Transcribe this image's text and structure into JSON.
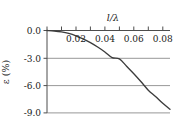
{
  "chart_data": {
    "type": "line",
    "title": "",
    "xlabel": "l/λ",
    "ylabel": "ε (%)",
    "xlim": [
      0.0,
      0.085
    ],
    "ylim": [
      -9.6,
      0.6
    ],
    "grid": true,
    "legend": null,
    "xticks": [
      0.02,
      0.04,
      0.06,
      0.08
    ],
    "xtick_labels": [
      "0.02",
      "0.04",
      "0.06",
      "0.08"
    ],
    "xminor_ticks": [
      0.0,
      0.01,
      0.02,
      0.03,
      0.04,
      0.05,
      0.06,
      0.07,
      0.08
    ],
    "yticks": [
      0.0,
      -3.0,
      -6.0,
      -9.0
    ],
    "ytick_labels": [
      "0.0",
      "-3.0",
      "-6.0",
      "-9.0"
    ],
    "gridlines_y": [
      -3.0,
      -6.0,
      -9.0
    ],
    "series": [
      {
        "name": "epsilon",
        "color": "#3c3c3c",
        "x": [
          0.0,
          0.005,
          0.01,
          0.015,
          0.02,
          0.025,
          0.03,
          0.035,
          0.04,
          0.045,
          0.05,
          0.055,
          0.06,
          0.065,
          0.07,
          0.075,
          0.08,
          0.085
        ],
        "y": [
          0.0,
          -0.05,
          -0.15,
          -0.32,
          -0.58,
          -0.92,
          -1.32,
          -1.8,
          -2.34,
          -2.96,
          -3.1,
          -3.9,
          -4.72,
          -5.6,
          -6.52,
          -7.2,
          -7.95,
          -8.6
        ]
      }
    ]
  },
  "axis_colors": {
    "frame": "#4d4d4d",
    "grid": "#8c8c8c",
    "curve": "#3c3c3c",
    "text": "#1a1a1a"
  },
  "tick_label_positions": {
    "x_axis_label_x": 0.047,
    "note": "x tick labels rendered below the top axis line"
  }
}
